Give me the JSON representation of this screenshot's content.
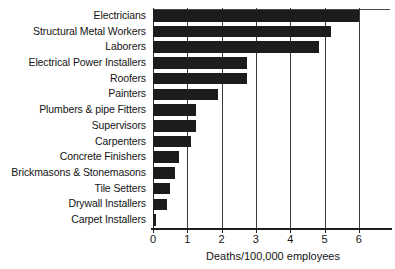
{
  "chart_data": {
    "type": "bar",
    "orientation": "horizontal",
    "title": "",
    "xlabel": "Deaths/100,000 employees",
    "ylabel": "",
    "xlim": [
      0,
      6.9
    ],
    "xticks": [
      0,
      1,
      2,
      3,
      4,
      5,
      6
    ],
    "xtick_labels": [
      "0",
      "1",
      "2",
      "3",
      "4",
      "5",
      "6"
    ],
    "grid": true,
    "grid_axis": "x",
    "legend": null,
    "bar_color": "#1c1c1c",
    "background_color": "#ffffff",
    "categories": [
      "Electricians",
      "Structural Metal Workers",
      "Laborers",
      "Electrical Power Installers",
      "Roofers",
      "Painters",
      "Plumbers & pipe Fitters",
      "Supervisors",
      "Carpenters",
      "Concrete Finishers",
      "Brickmasons & Stonemasons",
      "Tile Setters",
      "Drywall Installers",
      "Carpet Installers"
    ],
    "values": [
      6.0,
      5.2,
      4.85,
      2.75,
      2.75,
      1.9,
      1.25,
      1.25,
      1.1,
      0.75,
      0.65,
      0.5,
      0.4,
      0.1
    ]
  },
  "axis": {
    "x_title": "Deaths/100,000 employees",
    "tick_0": "0",
    "tick_1": "1",
    "tick_2": "2",
    "tick_3": "3",
    "tick_4": "4",
    "tick_5": "5",
    "tick_6": "6"
  },
  "labels": {
    "c0": "Electricians",
    "c1": "Structural Metal Workers",
    "c2": "Laborers",
    "c3": "Electrical Power Installers",
    "c4": "Roofers",
    "c5": "Painters",
    "c6": "Plumbers & pipe Fitters",
    "c7": "Supervisors",
    "c8": "Carpenters",
    "c9": "Concrete Finishers",
    "c10": "Brickmasons & Stonemasons",
    "c11": "Tile Setters",
    "c12": "Drywall Installers",
    "c13": "Carpet Installers"
  }
}
